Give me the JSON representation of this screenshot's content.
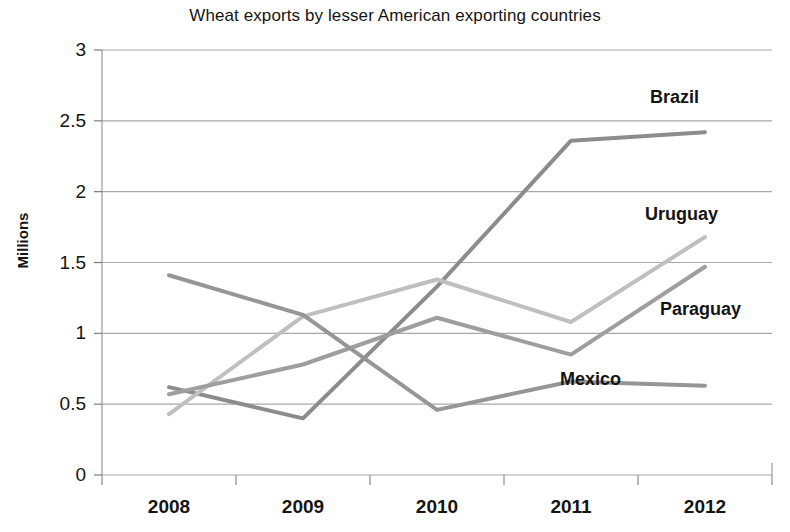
{
  "chart_data": {
    "type": "line",
    "title": "Wheat exports by lesser American exporting countries",
    "xlabel": "",
    "ylabel": "Millions",
    "categories": [
      "2008",
      "2009",
      "2010",
      "2011",
      "2012"
    ],
    "x": [
      2008,
      2009,
      2010,
      2011,
      2012
    ],
    "ylim": [
      0,
      3
    ],
    "ytick_labels": [
      "0",
      "0.5",
      "1",
      "1.5",
      "2",
      "2.5",
      "3"
    ],
    "yticks": [
      0,
      0.5,
      1,
      1.5,
      2,
      2.5,
      3
    ],
    "grid": true,
    "legend_position": "inline-end-of-line-labels",
    "series": [
      {
        "name": "Brazil",
        "color": "#8c8c8c",
        "values": [
          0.62,
          0.4,
          1.33,
          2.36,
          2.42
        ]
      },
      {
        "name": "Uruguay",
        "color": "#bfbfbf",
        "values": [
          0.43,
          1.12,
          1.38,
          1.08,
          1.68
        ]
      },
      {
        "name": "Paraguay",
        "color": "#9e9e9e",
        "values": [
          0.57,
          0.78,
          1.11,
          0.85,
          1.47
        ]
      },
      {
        "name": "Mexico",
        "color": "#969696",
        "values": [
          1.41,
          1.13,
          0.46,
          0.66,
          0.63
        ]
      }
    ],
    "annotations": [
      {
        "text": "Brazil",
        "x": 650,
        "y": 88
      },
      {
        "text": "Uruguay",
        "x": 645,
        "y": 205
      },
      {
        "text": "Paraguay",
        "x": 660,
        "y": 300
      },
      {
        "text": "Mexico",
        "x": 560,
        "y": 370
      }
    ]
  }
}
